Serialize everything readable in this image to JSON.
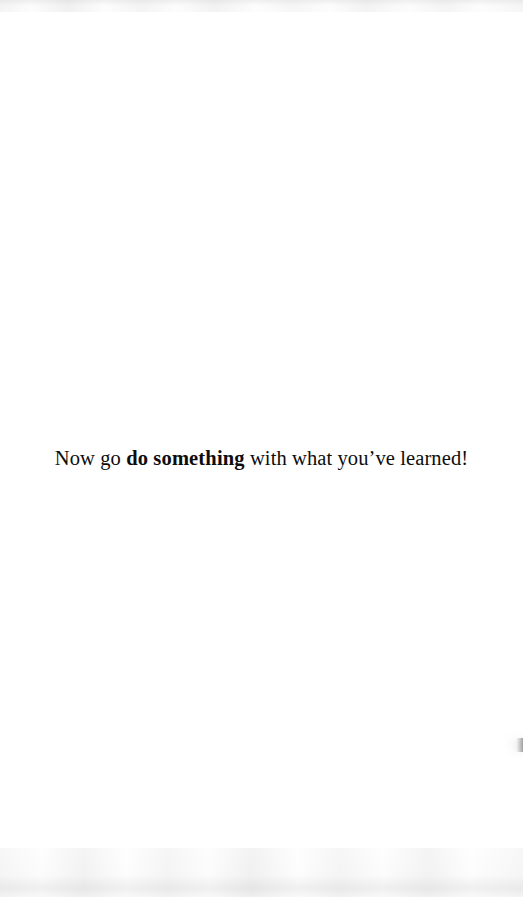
{
  "page": {
    "type": "scanned-book-page",
    "width": 523,
    "height": 897,
    "background_color": "#ffffff",
    "text_color": "#0d0d0d"
  },
  "body": {
    "line": {
      "segment_1": "Now go ",
      "segment_bold": "do something",
      "segment_2": " with what you’ve learned!",
      "full_text": "Now go do something with what you’ve learned!"
    }
  },
  "artifacts": {
    "top_noise_label": "scan-noise-top",
    "bottom_noise_label": "scan-noise-bottom",
    "edge_smudge_label": "right-edge-smudge"
  }
}
